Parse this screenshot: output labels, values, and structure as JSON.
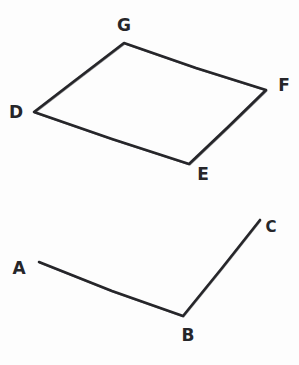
{
  "figure": {
    "background_color": "#fdfdfd",
    "stroke_color": "#26262a",
    "label_color": "#26262a",
    "canvas": {
      "width": 299,
      "height": 365
    },
    "shapes": [
      {
        "id": "quadrilateral-dgfe",
        "name": "quadrilateral DGFE",
        "type": "closed-polygon",
        "style": "hand-drawn",
        "stroke_width": 2.6,
        "vertex_order": [
          "D",
          "G",
          "F",
          "E"
        ],
        "vertices": [
          {
            "label": "D",
            "x": 34,
            "y": 112
          },
          {
            "label": "G",
            "x": 124,
            "y": 43
          },
          {
            "label": "F",
            "x": 266,
            "y": 90
          },
          {
            "label": "E",
            "x": 189,
            "y": 164
          }
        ],
        "edges": [
          {
            "from": "D",
            "to": "G"
          },
          {
            "from": "G",
            "to": "F"
          },
          {
            "from": "F",
            "to": "E"
          },
          {
            "from": "E",
            "to": "D"
          }
        ],
        "path": "M 34 112 L 73 82 L 124 43 L 196 68 L 266 90 L 228 127 L 189 164 L 112 139 L 34 112 Z"
      },
      {
        "id": "polyline-abc",
        "name": "open polyline A-B-C",
        "type": "open-polyline",
        "style": "hand-drawn",
        "stroke_width": 2.6,
        "vertex_order": [
          "A",
          "B",
          "C"
        ],
        "vertices": [
          {
            "label": "A",
            "x": 39,
            "y": 262
          },
          {
            "label": "B",
            "x": 183,
            "y": 316
          },
          {
            "label": "C",
            "x": 260,
            "y": 220
          }
        ],
        "edges": [
          {
            "from": "A",
            "to": "B"
          },
          {
            "from": "B",
            "to": "C"
          }
        ],
        "path": "M 39 262 L 112 291 L 183 316 L 222 268 L 260 220"
      }
    ],
    "labels": [
      {
        "id": "label-g",
        "text": "G",
        "x": 124,
        "y": 31,
        "font_size": 17,
        "anchor": "middle"
      },
      {
        "id": "label-f",
        "text": "F",
        "x": 284,
        "y": 91,
        "font_size": 17,
        "anchor": "middle"
      },
      {
        "id": "label-d",
        "text": "D",
        "x": 16,
        "y": 118,
        "font_size": 17,
        "anchor": "middle"
      },
      {
        "id": "label-e",
        "text": "E",
        "x": 203,
        "y": 180,
        "font_size": 17,
        "anchor": "middle"
      },
      {
        "id": "label-a",
        "text": "A",
        "x": 19,
        "y": 274,
        "font_size": 17,
        "anchor": "middle"
      },
      {
        "id": "label-b",
        "text": "B",
        "x": 188,
        "y": 341,
        "font_size": 17,
        "anchor": "middle"
      },
      {
        "id": "label-c",
        "text": "C",
        "x": 271,
        "y": 232,
        "font_size": 15,
        "anchor": "middle"
      }
    ]
  }
}
